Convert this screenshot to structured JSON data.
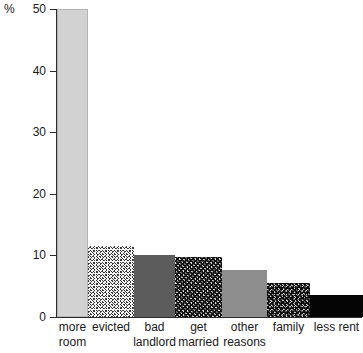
{
  "chart_data": {
    "type": "bar",
    "title": "",
    "subtitle": "",
    "xlabel": "",
    "ylabel": "%",
    "ylim": [
      0,
      50
    ],
    "yticks": [
      0,
      10,
      20,
      30,
      40,
      50
    ],
    "ytick_labels": [
      "0",
      "10",
      "20",
      "30",
      "40",
      "50"
    ],
    "grid": false,
    "legend": false,
    "categories": [
      "more room",
      "evicted",
      "bad landlord",
      "get married",
      "other reasons",
      "family",
      "less rent"
    ],
    "category_lines": [
      [
        "more",
        "room"
      ],
      [
        "evicted"
      ],
      [
        "bad",
        "landlord"
      ],
      [
        "get",
        "married"
      ],
      [
        "other",
        "reasons"
      ],
      [
        "family"
      ],
      [
        "less rent"
      ]
    ],
    "values": [
      50,
      11.5,
      10,
      9.7,
      7.7,
      5.5,
      3.5
    ],
    "bar_fills": [
      "light-gray",
      "speckle-light",
      "dark-gray",
      "speckle-coarse",
      "mid-gray",
      "speckle-dark",
      "black"
    ],
    "colors": {
      "light-gray": "#d2d2d2",
      "speckle-light": "#f4f4f4",
      "dark-gray": "#5c5c5c",
      "speckle-coarse": "#6a6a6a",
      "mid-gray": "#8d8d8d",
      "speckle-dark": "#585858",
      "black": "#050505",
      "axis": "#2b2b2b",
      "background": "#ffffff"
    }
  }
}
